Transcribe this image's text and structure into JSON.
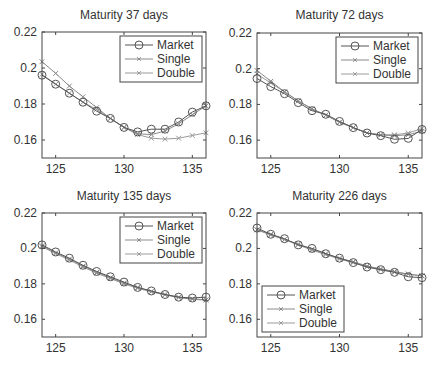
{
  "chart_data": [
    {
      "type": "line",
      "title": "Maturity 37 days",
      "xlabel": "",
      "ylabel": "",
      "xlim": [
        124,
        136
      ],
      "ylim": [
        0.15,
        0.22
      ],
      "xticks": [
        125,
        130,
        135
      ],
      "xtick_labels": [
        "125",
        "130",
        "135"
      ],
      "yticks": [
        0.16,
        0.18,
        0.2,
        0.22
      ],
      "ytick_labels": [
        "0.16",
        "0.18",
        "0.2",
        "0.22"
      ],
      "grid": false,
      "legend_position": "upper right",
      "x": [
        124,
        125,
        126,
        127,
        128,
        129,
        130,
        131,
        132,
        133,
        134,
        135,
        136
      ],
      "series": [
        {
          "name": "Market",
          "marker": "o",
          "color": "#555555",
          "values": [
            0.196,
            0.191,
            0.186,
            0.181,
            0.176,
            0.172,
            0.167,
            0.1645,
            0.166,
            0.166,
            0.17,
            0.1755,
            0.179
          ]
        },
        {
          "name": "Single",
          "marker": "x",
          "color": "#8a8a8a",
          "values": [
            0.2035,
            0.197,
            0.19,
            0.184,
            0.178,
            0.172,
            0.167,
            0.1635,
            0.163,
            0.165,
            0.169,
            0.174,
            0.179
          ]
        },
        {
          "name": "Double",
          "marker": "x",
          "color": "#9a9a9a",
          "values": [
            0.1965,
            0.191,
            0.186,
            0.181,
            0.177,
            0.172,
            0.167,
            0.163,
            0.161,
            0.1605,
            0.161,
            0.1625,
            0.164
          ]
        }
      ]
    },
    {
      "type": "line",
      "title": "Maturity 72 days",
      "xlabel": "",
      "ylabel": "",
      "xlim": [
        124,
        136
      ],
      "ylim": [
        0.15,
        0.22
      ],
      "xticks": [
        125,
        130,
        135
      ],
      "xtick_labels": [
        "125",
        "130",
        "135"
      ],
      "yticks": [
        0.16,
        0.18,
        0.2,
        0.22
      ],
      "ytick_labels": [
        "0.16",
        "0.18",
        "0.2",
        "0.22"
      ],
      "grid": false,
      "legend_position": "upper right",
      "x": [
        124,
        125,
        126,
        127,
        128,
        129,
        130,
        131,
        132,
        133,
        134,
        135,
        136
      ],
      "series": [
        {
          "name": "Market",
          "marker": "o",
          "color": "#555555",
          "values": [
            0.1945,
            0.19,
            0.186,
            0.181,
            0.1765,
            0.1745,
            0.1705,
            0.167,
            0.164,
            0.1625,
            0.1605,
            0.161,
            0.166
          ]
        },
        {
          "name": "Single",
          "marker": "x",
          "color": "#8a8a8a",
          "values": [
            0.199,
            0.193,
            0.187,
            0.182,
            0.1775,
            0.174,
            0.17,
            0.167,
            0.164,
            0.163,
            0.1625,
            0.163,
            0.165
          ]
        },
        {
          "name": "Double",
          "marker": "x",
          "color": "#9a9a9a",
          "values": [
            0.197,
            0.192,
            0.187,
            0.182,
            0.1775,
            0.174,
            0.17,
            0.167,
            0.164,
            0.163,
            0.163,
            0.164,
            0.1665
          ]
        }
      ]
    },
    {
      "type": "line",
      "title": "Maturity 135 days",
      "xlabel": "",
      "ylabel": "",
      "xlim": [
        124,
        136
      ],
      "ylim": [
        0.15,
        0.22
      ],
      "xticks": [
        125,
        130,
        135
      ],
      "xtick_labels": [
        "125",
        "130",
        "135"
      ],
      "yticks": [
        0.16,
        0.18,
        0.2,
        0.22
      ],
      "ytick_labels": [
        "0.16",
        "0.18",
        "0.2",
        "0.22"
      ],
      "grid": false,
      "legend_position": "upper right",
      "x": [
        124,
        125,
        126,
        127,
        128,
        129,
        130,
        131,
        132,
        133,
        134,
        135,
        136
      ],
      "series": [
        {
          "name": "Market",
          "marker": "o",
          "color": "#555555",
          "values": [
            0.202,
            0.198,
            0.1945,
            0.1905,
            0.187,
            0.184,
            0.181,
            0.178,
            0.176,
            0.174,
            0.1725,
            0.172,
            0.1725
          ]
        },
        {
          "name": "Single",
          "marker": "x",
          "color": "#8a8a8a",
          "values": [
            0.2015,
            0.1975,
            0.194,
            0.19,
            0.1865,
            0.1835,
            0.1805,
            0.178,
            0.1757,
            0.174,
            0.1725,
            0.1715,
            0.171
          ]
        },
        {
          "name": "Double",
          "marker": "x",
          "color": "#9a9a9a",
          "values": [
            0.201,
            0.197,
            0.1935,
            0.1895,
            0.186,
            0.183,
            0.18,
            0.1775,
            0.1755,
            0.1738,
            0.1722,
            0.1713,
            0.1708
          ]
        }
      ]
    },
    {
      "type": "line",
      "title": "Maturity 226 days",
      "xlabel": "",
      "ylabel": "",
      "xlim": [
        124,
        136
      ],
      "ylim": [
        0.15,
        0.22
      ],
      "xticks": [
        125,
        130,
        135
      ],
      "xtick_labels": [
        "125",
        "130",
        "135"
      ],
      "yticks": [
        0.16,
        0.18,
        0.2,
        0.22
      ],
      "ytick_labels": [
        "0.16",
        "0.18",
        "0.2",
        "0.22"
      ],
      "grid": false,
      "legend_position": "lower left",
      "x": [
        124,
        125,
        126,
        127,
        128,
        129,
        130,
        131,
        132,
        133,
        134,
        135,
        136
      ],
      "series": [
        {
          "name": "Market",
          "marker": "o",
          "color": "#555555",
          "values": [
            0.2115,
            0.208,
            0.2055,
            0.202,
            0.2,
            0.197,
            0.1945,
            0.192,
            0.1895,
            0.188,
            0.1865,
            0.184,
            0.1835
          ]
        },
        {
          "name": "Single",
          "marker": "x",
          "color": "#8a8a8a",
          "values": [
            0.2105,
            0.208,
            0.205,
            0.2025,
            0.1995,
            0.197,
            0.1945,
            0.1925,
            0.19,
            0.1885,
            0.187,
            0.1855,
            0.1845
          ]
        },
        {
          "name": "Double",
          "marker": "x",
          "color": "#9a9a9a",
          "values": [
            0.2105,
            0.2075,
            0.205,
            0.202,
            0.199,
            0.1965,
            0.194,
            0.192,
            0.1895,
            0.188,
            0.1865,
            0.1855,
            0.1845
          ]
        }
      ]
    }
  ],
  "panels": [
    {
      "title": "Maturity 37 days"
    },
    {
      "title": "Maturity 72 days"
    },
    {
      "title": "Maturity 135 days"
    },
    {
      "title": "Maturity 226 days"
    }
  ],
  "legend": {
    "labels": [
      "Market",
      "Single",
      "Double"
    ]
  }
}
